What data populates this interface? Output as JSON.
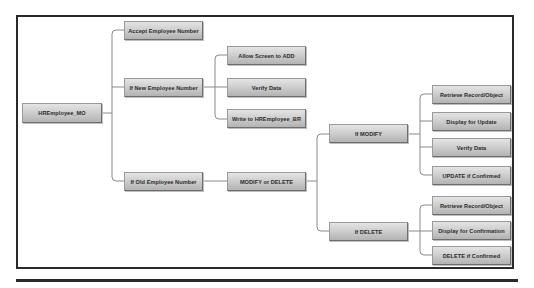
{
  "diagram": {
    "type": "tree",
    "root": {
      "label": "HREmployee_MO"
    },
    "level1": {
      "accept": {
        "label": "Accept Employee Number"
      },
      "new": {
        "label": "If New Employee Number"
      },
      "old": {
        "label": "If Old Employee Number"
      }
    },
    "new_branch": {
      "allow": {
        "label": "Allow Screen to ADD"
      },
      "verify": {
        "label": "Verify Data"
      },
      "write": {
        "label": "Write to HREmployee_BR"
      }
    },
    "old_branch": {
      "choice": {
        "label": "MODIFY or DELETE"
      }
    },
    "modify": {
      "label": "If MODIFY",
      "steps": [
        {
          "label": "Retrieve Record/Object"
        },
        {
          "label": "Display for Update"
        },
        {
          "label": "Verify Data"
        },
        {
          "label": "UPDATE if Confirmed"
        }
      ]
    },
    "delete": {
      "label": "If DELETE",
      "steps": [
        {
          "label": "Retrieve Record/Object"
        },
        {
          "label": "Display for Confirmation"
        },
        {
          "label": "DELETE if Confirmed"
        }
      ]
    },
    "colors": {
      "frame": "#2a2a2a",
      "connector": "#8a8a8a",
      "node_top": "#e4e4e4",
      "node_bottom": "#b3b3b3",
      "text": "#2b2b2b"
    }
  }
}
